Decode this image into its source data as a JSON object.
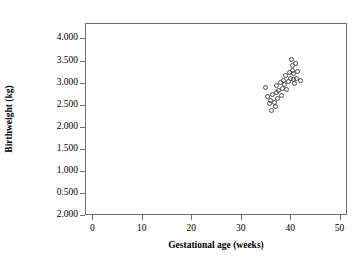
{
  "chart_data": {
    "type": "scatter",
    "title": "",
    "xlabel": "Gestational age (weeks)",
    "ylabel": "Birthweight (kg)",
    "xlim": [
      -1.5,
      51.5
    ],
    "ylim": [
      0.0,
      4.35
    ],
    "grid": false,
    "legend": null,
    "marker": "open-circle",
    "xticks": [
      0,
      10,
      20,
      30,
      40,
      50
    ],
    "xtick_labels": [
      "0",
      "10",
      "20",
      "30",
      "40",
      "50"
    ],
    "yticks": [
      4.0,
      3.5,
      3.0,
      2.5,
      2.0,
      1.5,
      1.0,
      0.5,
      0.0
    ],
    "ytick_labels": [
      "4.000",
      "3.500",
      "3.000",
      "2.500",
      "2.000",
      "1.500",
      "1.000",
      "0.500",
      "2.000"
    ],
    "x": [
      34.8,
      35.2,
      35.6,
      35.9,
      36.1,
      36.3,
      36.6,
      36.8,
      37.0,
      37.1,
      37.3,
      37.5,
      37.8,
      38.0,
      38.2,
      38.4,
      38.6,
      38.9,
      39.1,
      39.4,
      39.6,
      39.9,
      40.1,
      40.2,
      40.3,
      40.4,
      40.5,
      40.6,
      40.8,
      41.0,
      41.3,
      41.8
    ],
    "y": [
      2.92,
      2.7,
      2.55,
      2.62,
      2.38,
      2.75,
      2.58,
      2.48,
      2.8,
      2.95,
      2.66,
      2.85,
      3.02,
      2.74,
      2.9,
      3.08,
      2.98,
      3.18,
      2.86,
      3.05,
      3.24,
      3.12,
      3.55,
      3.4,
      3.3,
      3.22,
      3.1,
      3.0,
      3.45,
      3.12,
      3.28,
      3.08
    ]
  }
}
